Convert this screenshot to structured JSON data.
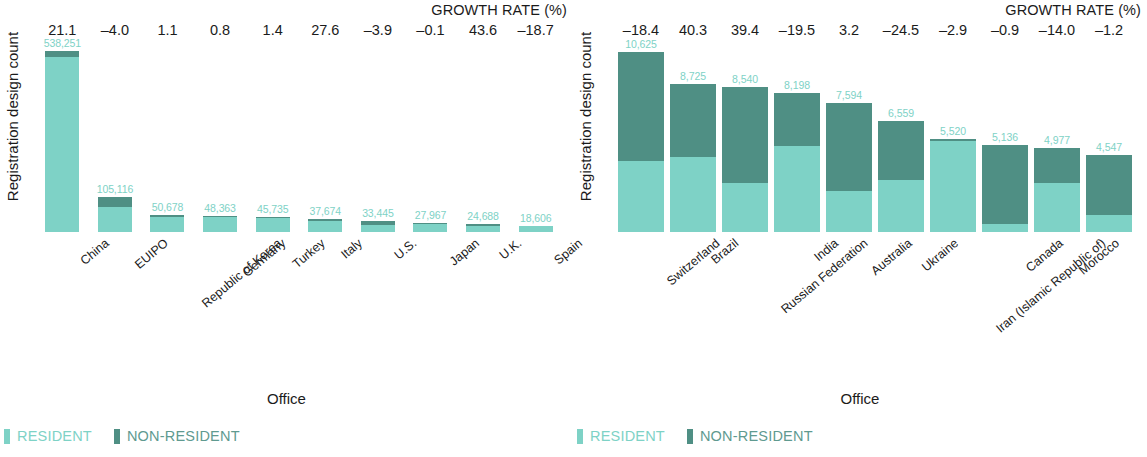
{
  "colors": {
    "resident": "#7ed2c6",
    "non_resident": "#4f8f84",
    "resident_text": "#7ed2c6",
    "non_resident_text": "#5f9a90",
    "text": "#1b1b1b"
  },
  "legend": {
    "resident_label": "RESIDENT",
    "non_resident_label": "NON-RESIDENT"
  },
  "axis": {
    "y_title": "Registration design count",
    "x_title": "Office",
    "growth_title": "GROWTH RATE (%)"
  },
  "chart_data": [
    {
      "type": "bar",
      "panel": "left",
      "title": "",
      "xlabel": "Office",
      "ylabel": "Registration design count",
      "stacked": true,
      "ylim": [
        0,
        560000
      ],
      "grid": false,
      "legend_position": "bottom-left",
      "annotation_title": "GROWTH RATE (%)",
      "categories": [
        "China",
        "EUIPO",
        "Republic of Korea",
        "Germany",
        "Turkey",
        "Italy",
        "U.S.",
        "Japan",
        "U.K.",
        "Spain"
      ],
      "totals": [
        538251,
        105116,
        50678,
        48363,
        45735,
        37674,
        33445,
        27967,
        24688,
        18606
      ],
      "total_labels": [
        "538,251",
        "105,116",
        "50,678",
        "48,363",
        "45,735",
        "37,674",
        "33,445",
        "27,967",
        "24,688",
        "18,606"
      ],
      "growth_rate": [
        "21.1",
        "–4.0",
        "1.1",
        "0.8",
        "1.4",
        "27.6",
        "–3.9",
        "–0.1",
        "43.6",
        "–18.7"
      ],
      "series": [
        {
          "name": "RESIDENT",
          "values": [
            521000,
            75000,
            46000,
            44000,
            40500,
            33500,
            21000,
            24500,
            18000,
            16500
          ]
        },
        {
          "name": "NON-RESIDENT",
          "values": [
            17251,
            30116,
            4678,
            4363,
            5235,
            4174,
            12445,
            3467,
            6688,
            2106
          ]
        }
      ]
    },
    {
      "type": "bar",
      "panel": "right",
      "title": "",
      "xlabel": "Office",
      "ylabel": "Registration design count",
      "stacked": true,
      "ylim": [
        0,
        11100
      ],
      "grid": false,
      "legend_position": "bottom-left",
      "annotation_title": "GROWTH RATE (%)",
      "categories": [
        "Switzerland",
        "Brazil",
        "Russian Federation",
        "India",
        "Australia",
        "Ukraine",
        "Iran (Islamic Republic of)",
        "Canada",
        "Morocco",
        "China, Hong Kong SAR"
      ],
      "totals": [
        10625,
        8725,
        8540,
        8198,
        7594,
        6559,
        5520,
        5136,
        4977,
        4547
      ],
      "total_labels": [
        "10,625",
        "8,725",
        "8,540",
        "8,198",
        "7,594",
        "6,559",
        "5,520",
        "5,136",
        "4,977",
        "4,547"
      ],
      "growth_rate": [
        "–18.4",
        "40.3",
        "39.4",
        "–19.5",
        "3.2",
        "–24.5",
        "–2.9",
        "–0.9",
        "–14.0",
        "–1.2"
      ],
      "series": [
        {
          "name": "RESIDENT",
          "values": [
            4200,
            4400,
            2900,
            5100,
            2400,
            3100,
            5400,
            450,
            2900,
            1000
          ]
        },
        {
          "name": "NON-RESIDENT",
          "values": [
            6425,
            4325,
            5640,
            3098,
            5194,
            3459,
            120,
            4686,
            2077,
            3547
          ]
        }
      ]
    }
  ]
}
